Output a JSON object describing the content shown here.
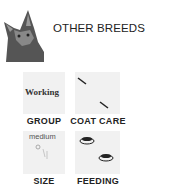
{
  "header": {
    "title": "OTHER BREEDS"
  },
  "attributes": [
    {
      "label": "GROUP",
      "value": "Working"
    },
    {
      "label": "COAT CARE",
      "icon": "comb-icon"
    },
    {
      "label": "SIZE",
      "value": "medium"
    },
    {
      "label": "FEEDING",
      "icon": "food-bowl-icon"
    }
  ]
}
